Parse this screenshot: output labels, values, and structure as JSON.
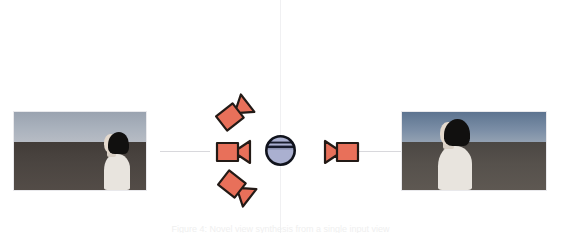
{
  "figure": {
    "caption": "Figure 4: Novel view synthesis from a single input view",
    "accent_camera_color": "#e8705a",
    "camera_outline_color": "#231a16",
    "sphere_color": "#aab0d0",
    "sphere_outline_color": "#10131c",
    "guide_line_color": "#d8d8dc",
    "divider_color": "#f0f0f2"
  },
  "thumbnails": [
    {
      "id": "input-view",
      "role": "input-view-thumbnail",
      "alt": "3D rendered person in white top with black bob hair, shown in profile facing right against a grey ground and pale blue sky",
      "sky_color": "#aab2bd",
      "ground_color": "#4a4440",
      "person_skin_color": "#e4d9cd",
      "person_hair_color": "#11100f",
      "person_clothing_color": "#e8e4de"
    },
    {
      "id": "output-view",
      "role": "output-view-thumbnail",
      "alt": "3D rendered person in white top with black bob hair, shown in profile facing right, positioned left of frame against a grey ground and blue sky",
      "sky_color": "#7b8ea6",
      "ground_color": "#56514c",
      "person_skin_color": "#e4d9cd",
      "person_hair_color": "#11100f",
      "person_clothing_color": "#e8e4de"
    }
  ],
  "cameras": [
    {
      "id": "camera-top-left",
      "label": "Camera top-left",
      "rotation_deg": -38,
      "facing": "right"
    },
    {
      "id": "camera-middle-left",
      "label": "Camera middle-left",
      "rotation_deg": 0,
      "facing": "right"
    },
    {
      "id": "camera-bottom-left",
      "label": "Camera bottom-left",
      "rotation_deg": 38,
      "facing": "right"
    },
    {
      "id": "camera-right",
      "label": "Camera right",
      "rotation_deg": 0,
      "facing": "left"
    }
  ],
  "sphere": {
    "id": "scene-sphere",
    "label": "Scene sphere",
    "band_count": 2
  }
}
